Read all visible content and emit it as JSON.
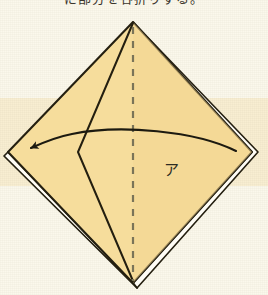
{
  "figure": {
    "title_text": "に部分を谷折りする。",
    "label_a": "ア",
    "colors": {
      "paper_fill": "#f6dd9c",
      "paper_fill_shade": "#f2d691",
      "outline": "#241f10",
      "fold_dash": "#7a7458",
      "arrow": "#1c1a10",
      "background": "#fbf8ec",
      "background_band": "#f8eed2",
      "layer_gap": "#fffdf6"
    },
    "geometry": {
      "apex_top": [
        133,
        22
      ],
      "vertex_left": [
        8,
        152
      ],
      "vertex_right": [
        252,
        152
      ],
      "vertex_bottom": [
        133,
        283
      ],
      "center_fold_top": [
        133,
        26
      ],
      "center_fold_bottom": [
        133,
        281
      ],
      "inner_fold_mid": [
        78,
        152
      ],
      "arrow_start": [
        236,
        151
      ],
      "arrow_tip": [
        28,
        149
      ]
    },
    "elements": {
      "paper_name": "folded-paper-diamond",
      "center_line_name": "center-fold-dashed-line",
      "inner_fold_name": "inner-fold-line",
      "arrow_name": "fold-direction-arrow",
      "layer_edge_right_name": "layered-edge-right",
      "layer_edge_bottom_left_name": "layered-edge-bottom-left",
      "layer_edge_bottom_right_name": "layered-edge-bottom-right"
    }
  }
}
